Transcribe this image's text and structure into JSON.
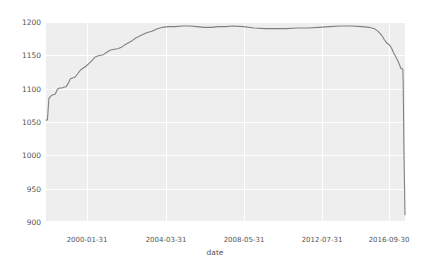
{
  "chart_data": {
    "type": "line",
    "title": "",
    "xlabel": "date",
    "ylabel": "",
    "ylim": [
      900,
      1200
    ],
    "yticks": [
      900,
      950,
      1000,
      1050,
      1100,
      1150,
      1200
    ],
    "ytick_labels": [
      "900",
      "950",
      "1000",
      "1050",
      "1100",
      "1150",
      "1200"
    ],
    "xtick_labels": [
      "2000-01-31",
      "2004-03-31",
      "2008-05-31",
      "2012-07-31",
      "2016-09-30"
    ],
    "xtick_positions": [
      87,
      166,
      244,
      322,
      389
    ],
    "grid": true,
    "legend": null,
    "line_color": "#808080",
    "plot_bg": "#eeeeee",
    "grid_color": "#ffffff",
    "series": [
      {
        "name": "count",
        "x": [
          0.0,
          0.4,
          0.8,
          1.2,
          1.6,
          2.0,
          2.6,
          3.2,
          3.8,
          4.4,
          5.0,
          5.6,
          6.2,
          6.8,
          7.4,
          8.0,
          8.8,
          9.6,
          10.4,
          11.2,
          12.0,
          12.8,
          13.6,
          14.4,
          15.2,
          16.0,
          17.0,
          18.0,
          19.0,
          20.0,
          21.0,
          22.0,
          23.0,
          24.0,
          25.0,
          26.5,
          28.0,
          29.5,
          31.0,
          32.5,
          34.0,
          36.0,
          38.0,
          40.0,
          42.0,
          44.0,
          46.0,
          48.0,
          50.0,
          52.0,
          55.0,
          58.0,
          61.0,
          64.0,
          67.0,
          70.0,
          73.0,
          76.0,
          79.0,
          82.0,
          85.0,
          88.0,
          90.0,
          91.5,
          92.5,
          93.5,
          94.3,
          95.0,
          95.6,
          96.0,
          96.4,
          96.8,
          97.2,
          97.6,
          98.0,
          98.3,
          98.6,
          98.8,
          99.0,
          99.2,
          99.4,
          99.5,
          99.6,
          99.7,
          99.8,
          99.9,
          99.95,
          100.0
        ],
        "y": [
          1053,
          1053,
          1085,
          1088,
          1090,
          1091,
          1092,
          1099,
          1101,
          1101,
          1102,
          1103,
          1108,
          1115,
          1116,
          1117,
          1122,
          1128,
          1131,
          1134,
          1138,
          1142,
          1147,
          1149,
          1150,
          1151,
          1155,
          1158,
          1159,
          1160,
          1162,
          1166,
          1169,
          1172,
          1176,
          1180,
          1184,
          1186,
          1190,
          1192,
          1193,
          1193,
          1194,
          1194,
          1193,
          1192,
          1192,
          1193,
          1193,
          1194,
          1193,
          1191,
          1190,
          1190,
          1190,
          1191,
          1191,
          1192,
          1193,
          1194,
          1194,
          1193,
          1192,
          1190,
          1186,
          1180,
          1173,
          1168,
          1166,
          1163,
          1159,
          1154,
          1150,
          1146,
          1142,
          1138,
          1134,
          1131,
          1130,
          1130,
          1129,
          1110,
          1060,
          1010,
          975,
          945,
          925,
          911
        ]
      }
    ]
  },
  "axes": {
    "x_axis_title": "date"
  }
}
